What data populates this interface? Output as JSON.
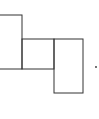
{
  "diagram": {
    "stroke_color": "#333333",
    "background": "#ffffff",
    "shapes": [
      {
        "name": "rect-left",
        "x": -2,
        "y": 15,
        "width": 24,
        "height": 54
      },
      {
        "name": "rect-middle",
        "x": 22,
        "y": 39,
        "width": 32,
        "height": 30
      },
      {
        "name": "rect-right",
        "x": 54,
        "y": 39,
        "width": 29,
        "height": 54
      }
    ],
    "dot": {
      "x": 96,
      "y": 67,
      "r": 0.9
    },
    "label": "."
  }
}
